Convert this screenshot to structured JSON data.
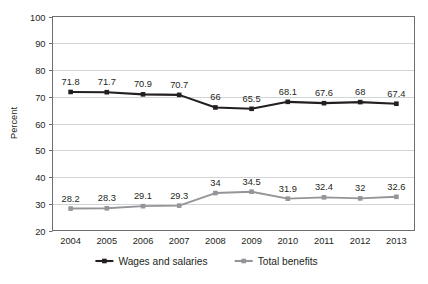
{
  "chart_data": {
    "type": "line",
    "title": "",
    "xlabel": "",
    "ylabel": "Percent",
    "categories": [
      "2004",
      "2005",
      "2006",
      "2007",
      "2008",
      "2009",
      "2010",
      "2011",
      "2012",
      "2013"
    ],
    "x": [
      2004,
      2005,
      2006,
      2007,
      2008,
      2009,
      2010,
      2011,
      2012,
      2013
    ],
    "ylim": [
      20,
      100
    ],
    "yticks": [
      20,
      30,
      40,
      50,
      60,
      70,
      80,
      90,
      100
    ],
    "ytick_labels": [
      "20",
      "30",
      "40",
      "50",
      "60",
      "70",
      "80",
      "90",
      "100"
    ],
    "grid": true,
    "grid_axis": "y",
    "legend_position": "bottom",
    "data_labels": true,
    "series": [
      {
        "name": "Wages and salaries",
        "color": "#231f20",
        "marker": "square",
        "values": [
          71.8,
          71.7,
          70.9,
          70.7,
          66,
          65.5,
          68.1,
          67.6,
          68,
          67.4
        ],
        "labels": [
          "71.8",
          "71.7",
          "70.9",
          "70.7",
          "66",
          "65.5",
          "68.1",
          "67.6",
          "68",
          "67.4"
        ]
      },
      {
        "name": "Total benefits",
        "color": "#939598",
        "marker": "square",
        "values": [
          28.2,
          28.3,
          29.1,
          29.3,
          34,
          34.5,
          31.9,
          32.4,
          32,
          32.6
        ],
        "labels": [
          "28.2",
          "28.3",
          "29.1",
          "29.3",
          "34",
          "34.5",
          "31.9",
          "32.4",
          "32",
          "32.6"
        ]
      }
    ]
  },
  "legend": {
    "items": [
      {
        "label": "Wages and salaries",
        "color": "#231f20"
      },
      {
        "label": "Total benefits",
        "color": "#939598"
      }
    ]
  },
  "colors": {
    "wages": "#231f20",
    "benefits": "#939598",
    "gridline": "#c8c9cb",
    "frame": "#6d6e71",
    "background": "#ffffff"
  }
}
